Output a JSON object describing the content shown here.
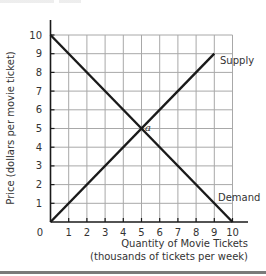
{
  "chart_data": {
    "type": "line",
    "title": "",
    "xlabel": "Quantity of Movie Tickets",
    "xlabel_line2": "(thousands of tickets per week)",
    "ylabel": "Price (dollars per movie ticket)",
    "xlim": [
      0,
      10
    ],
    "ylim": [
      0,
      10
    ],
    "x_ticks": [
      "0",
      "1",
      "2",
      "3",
      "4",
      "5",
      "6",
      "7",
      "8",
      "9",
      "10"
    ],
    "y_ticks": [
      "1",
      "2",
      "3",
      "4",
      "5",
      "6",
      "7",
      "8",
      "9",
      "10"
    ],
    "grid": true,
    "series": [
      {
        "name": "Supply",
        "x": [
          0,
          9
        ],
        "y": [
          0,
          9
        ]
      },
      {
        "name": "Demand",
        "x": [
          0,
          10
        ],
        "y": [
          10,
          0
        ]
      }
    ],
    "annotations": [
      {
        "text": "a",
        "x": 5,
        "y": 5,
        "note": "equilibrium point"
      }
    ],
    "colors": {
      "line": "#1a1a1a",
      "grid": "#a8a8a8",
      "axis": "#1a1a1a",
      "text": "#333333"
    }
  }
}
